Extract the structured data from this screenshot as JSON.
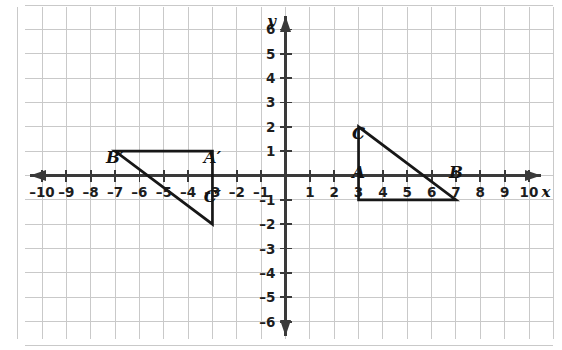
{
  "chart_data": {
    "type": "scatter",
    "title": "",
    "xlabel": "x",
    "ylabel": "y",
    "xlim": [
      -10.7,
      11.0
    ],
    "ylim": [
      -6.7,
      6.9
    ],
    "grid": true,
    "legend": "none",
    "x_ticks": [
      -10,
      -9,
      -8,
      -7,
      -6,
      -5,
      -4,
      -3,
      -2,
      -1,
      1,
      2,
      3,
      4,
      5,
      6,
      7,
      8,
      9,
      10
    ],
    "y_ticks": [
      6,
      5,
      4,
      3,
      2,
      1,
      -1,
      -2,
      -3,
      -4,
      -5,
      -6
    ],
    "x_tick_labels": [
      "–10",
      "–9",
      "–8",
      "–7",
      "–6",
      "–5",
      "–4",
      "–3",
      "–2",
      "–1",
      "1",
      "2",
      "3",
      "4",
      "5",
      "6",
      "7",
      "8",
      "9",
      "10"
    ],
    "y_tick_labels": [
      "6",
      "5",
      "4",
      "3",
      "2",
      "1",
      "–1",
      "–2",
      "–3",
      "–4",
      "–5",
      "–6"
    ],
    "shapes": [
      {
        "name": "triangle-abc",
        "closed": true,
        "vertices": [
          {
            "label": "A",
            "x": 3,
            "y": -1,
            "label_dx": 0,
            "label_dy": -22
          },
          {
            "label": "B",
            "x": 7,
            "y": -1,
            "label_dx": 0,
            "label_dy": -22
          },
          {
            "label": "C",
            "x": 3,
            "y": 2,
            "label_dx": 0,
            "label_dy": 12
          }
        ]
      },
      {
        "name": "triangle-a-prime-b-prime-c-prime",
        "closed": true,
        "vertices": [
          {
            "label": "A′",
            "x": -3,
            "y": 1,
            "label_dx": 0,
            "label_dy": 12
          },
          {
            "label": "B′",
            "x": -7,
            "y": 1,
            "label_dx": 0,
            "label_dy": 12
          },
          {
            "label": "C′",
            "x": -3,
            "y": -2,
            "label_dx": 0,
            "label_dy": -22
          }
        ]
      }
    ],
    "axis_arrows": [
      "left",
      "right",
      "up",
      "down"
    ]
  }
}
